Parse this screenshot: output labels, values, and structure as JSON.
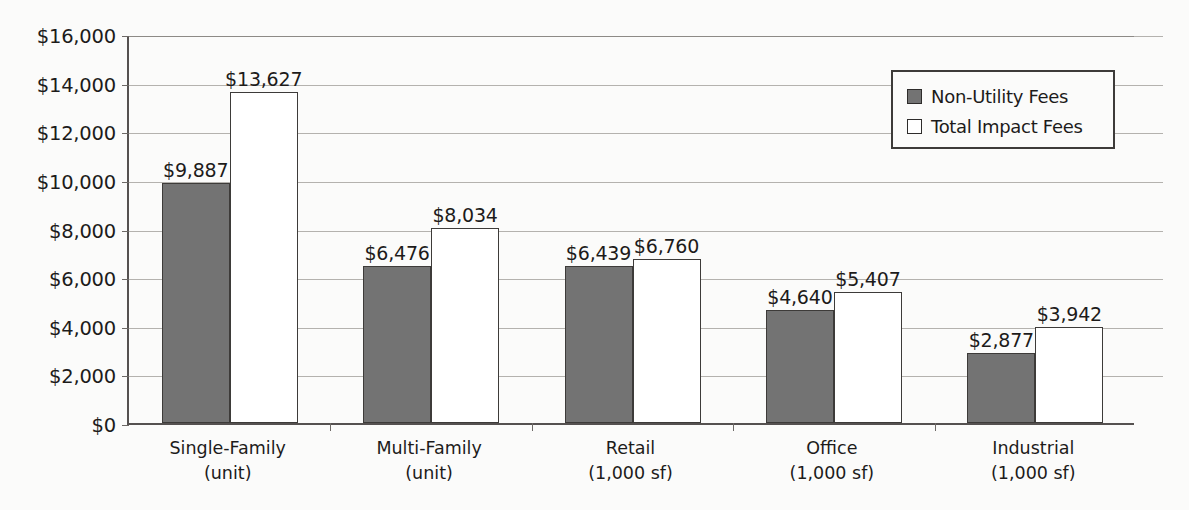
{
  "chart_data": {
    "type": "bar",
    "title": "",
    "xlabel": "",
    "ylabel": "",
    "ylim": [
      0,
      16000
    ],
    "ytick_values": [
      0,
      2000,
      4000,
      6000,
      8000,
      10000,
      12000,
      14000,
      16000
    ],
    "ytick_labels": [
      "$0",
      "$2,000",
      "$4,000",
      "$6,000",
      "$8,000",
      "$10,000",
      "$12,000",
      "$14,000",
      "$16,000"
    ],
    "grid": true,
    "legend_position": "top-right",
    "categories": [
      {
        "name": "Single-Family",
        "unit": "(unit)"
      },
      {
        "name": "Multi-Family",
        "unit": "(unit)"
      },
      {
        "name": "Retail",
        "unit": "(1,000 sf)"
      },
      {
        "name": "Office",
        "unit": "(1,000 sf)"
      },
      {
        "name": "Industrial",
        "unit": "(1,000 sf)"
      }
    ],
    "series": [
      {
        "name": "Non-Utility Fees",
        "color": "#737373",
        "values": [
          9887,
          6476,
          6439,
          4640,
          2877
        ],
        "labels": [
          "$9,887",
          "$6,476",
          "$6,439",
          "$4,640",
          "$2,877"
        ]
      },
      {
        "name": "Total Impact Fees",
        "color": "#ffffff",
        "values": [
          13627,
          8034,
          6760,
          5407,
          3942
        ],
        "labels": [
          "$13,627",
          "$8,034",
          "$6,760",
          "$5,407",
          "$3,942"
        ]
      }
    ]
  },
  "legend": {
    "items": [
      {
        "label": "Non-Utility Fees"
      },
      {
        "label": "Total Impact Fees"
      }
    ]
  }
}
